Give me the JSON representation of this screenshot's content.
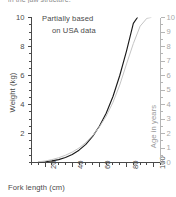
{
  "clipped_caption": "in the jaw structure.",
  "chart_data": {
    "type": "line",
    "title": "",
    "annotation": [
      "Partially based",
      "on USA data"
    ],
    "xlabel": "Fork length (cm)",
    "ylabel": "Weight (kg)",
    "y2label": "Age in years",
    "xlim": [
      10,
      105
    ],
    "ylim": [
      0,
      10
    ],
    "y2lim": [
      0,
      10
    ],
    "xticks": [
      20,
      40,
      60,
      80,
      100
    ],
    "yticks": [
      2,
      4,
      6,
      8,
      10
    ],
    "y2ticks": [
      0,
      1,
      2,
      3,
      4,
      5,
      6,
      7,
      8,
      9,
      10
    ],
    "grid": false,
    "legend": "none",
    "series": [
      {
        "name": "Weight (kg)",
        "axis": "left",
        "color": "#1a1a1a",
        "x": [
          15,
          20,
          25,
          30,
          35,
          40,
          45,
          50,
          55,
          60,
          65,
          70,
          75,
          80,
          85,
          88
        ],
        "y": [
          0.02,
          0.05,
          0.11,
          0.2,
          0.34,
          0.55,
          0.85,
          1.25,
          1.8,
          2.5,
          3.4,
          4.55,
          6.0,
          7.7,
          9.6,
          10.0
        ]
      },
      {
        "name": "Age in years",
        "axis": "right",
        "color": "#c4c4c4",
        "x": [
          15,
          20,
          25,
          30,
          35,
          40,
          45,
          50,
          55,
          60,
          65,
          70,
          75,
          80,
          85,
          90,
          95,
          98
        ],
        "y": [
          0.05,
          0.1,
          0.2,
          0.33,
          0.5,
          0.72,
          1.0,
          1.38,
          1.85,
          2.45,
          3.2,
          4.15,
          5.35,
          6.8,
          8.2,
          9.4,
          9.95,
          10.0
        ]
      }
    ]
  }
}
